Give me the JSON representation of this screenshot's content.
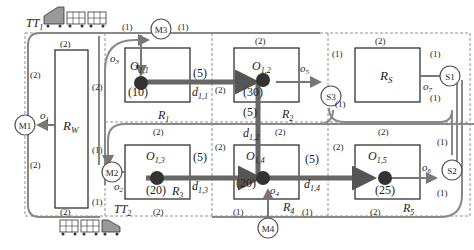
{
  "diagram": {
    "trains": [
      {
        "id": "TT1",
        "label": "TT",
        "sub": "1"
      },
      {
        "id": "TT2",
        "label": "TT",
        "sub": "2"
      }
    ],
    "regions": [
      {
        "id": "RW",
        "label": "R",
        "sub": "W"
      },
      {
        "id": "RS",
        "label": "R",
        "sub": "S"
      },
      {
        "id": "R1",
        "label": "R",
        "sub": "1"
      },
      {
        "id": "R2",
        "label": "R",
        "sub": "2"
      },
      {
        "id": "R3",
        "label": "R",
        "sub": "3"
      },
      {
        "id": "R4",
        "label": "R",
        "sub": "4"
      },
      {
        "id": "R5",
        "label": "R",
        "sub": "5"
      }
    ],
    "machines": [
      {
        "id": "M1",
        "label": "M1"
      },
      {
        "id": "M2",
        "label": "M2"
      },
      {
        "id": "M3",
        "label": "M3"
      },
      {
        "id": "M4",
        "label": "M4"
      },
      {
        "id": "S1",
        "label": "S1"
      },
      {
        "id": "S2",
        "label": "S2"
      },
      {
        "id": "S3",
        "label": "S3"
      }
    ],
    "operations": [
      {
        "id": "O11",
        "label": "O",
        "sub": "1,1",
        "value": "(10)"
      },
      {
        "id": "O12",
        "label": "O",
        "sub": "1,2",
        "value": "(30)"
      },
      {
        "id": "O13",
        "label": "O",
        "sub": "1,3",
        "value": "(20)"
      },
      {
        "id": "O14",
        "label": "O",
        "sub": "1,4",
        "value": "(20)"
      },
      {
        "id": "O15",
        "label": "O",
        "sub": "1,5",
        "value": "(25)"
      }
    ],
    "distances": [
      {
        "id": "d11",
        "label": "d",
        "sub": "1,1",
        "value": "(5)"
      },
      {
        "id": "d12",
        "label": "d",
        "sub": "1,2",
        "value": "(5)"
      },
      {
        "id": "d13",
        "label": "d",
        "sub": "1,3",
        "value": "(5)"
      },
      {
        "id": "d14",
        "label": "d",
        "sub": "1,4",
        "value": "(5)"
      }
    ],
    "outputs": [
      {
        "id": "o1",
        "label": "o",
        "sub": "1"
      },
      {
        "id": "o2",
        "label": "o",
        "sub": "2"
      },
      {
        "id": "o3",
        "label": "o",
        "sub": "3"
      },
      {
        "id": "o4",
        "label": "o",
        "sub": "4"
      },
      {
        "id": "o5",
        "label": "o",
        "sub": "5"
      },
      {
        "id": "o6",
        "label": "o",
        "sub": "6"
      },
      {
        "id": "o7",
        "label": "o",
        "sub": "7"
      }
    ],
    "edge_weights": {
      "w1": "(1)",
      "w2": "(2)"
    },
    "colors": {
      "path_thick": "#666666",
      "path_thin": "#888888",
      "box": "#222222",
      "grid": "#777777",
      "train_engine": "#999999"
    }
  }
}
